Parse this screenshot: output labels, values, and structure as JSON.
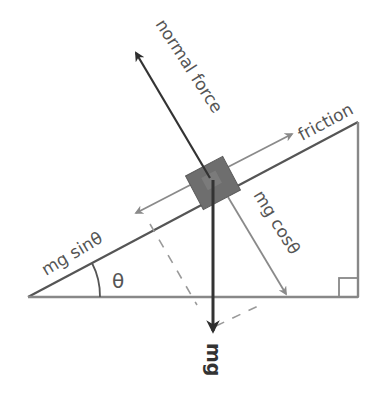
{
  "diagram": {
    "labels": {
      "normal_force": "normal force",
      "friction": "friction",
      "mg_sin": "mg sinθ",
      "mg_cos": "mg cosθ",
      "mg": "mg",
      "theta": "θ"
    },
    "colors": {
      "incline": "#555555",
      "dark_arrow": "#333333",
      "light_arrow": "#8a8a8a",
      "block": "#6e6e6e",
      "text": "#555555",
      "dashed": "#9a9a9a"
    },
    "incline_triangle": {
      "vertices": [
        [
          28,
          297
        ],
        [
          358,
          122
        ],
        [
          358,
          297
        ]
      ],
      "angle_deg": 27.9,
      "right_angle_marker": true
    },
    "forces": [
      {
        "name": "normal force",
        "direction": "perpendicular away from incline",
        "style": "dark"
      },
      {
        "name": "friction",
        "direction": "up the incline",
        "style": "light"
      },
      {
        "name": "mg sinθ",
        "direction": "down the incline",
        "style": "light"
      },
      {
        "name": "mg cosθ",
        "direction": "perpendicular into incline",
        "style": "light"
      },
      {
        "name": "mg",
        "direction": "vertically downward",
        "style": "dark"
      }
    ]
  }
}
